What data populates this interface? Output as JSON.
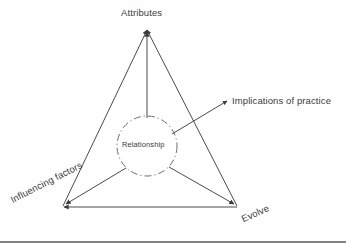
{
  "diagram": {
    "type": "triangle-relationship-diagram",
    "nodes": [
      {
        "id": "attributes",
        "label": "Attributes",
        "position": "top-apex"
      },
      {
        "id": "influencing-factors",
        "label": "Influencing factors",
        "position": "bottom-left"
      },
      {
        "id": "evolve",
        "label": "Evolve",
        "position": "bottom-right"
      }
    ],
    "center": {
      "id": "relationship",
      "label": "Relationship",
      "shape": "dash-dot-circle"
    },
    "callout": {
      "id": "implications-of-practice",
      "label": "Implications of practice",
      "arrow": "up-right"
    },
    "colors": {
      "line": "#4a4a4a",
      "text": "#3b3b3b",
      "arrowhead": "#3c3c3c",
      "background": "#ffffff",
      "rule": "#5a5a5a"
    }
  }
}
